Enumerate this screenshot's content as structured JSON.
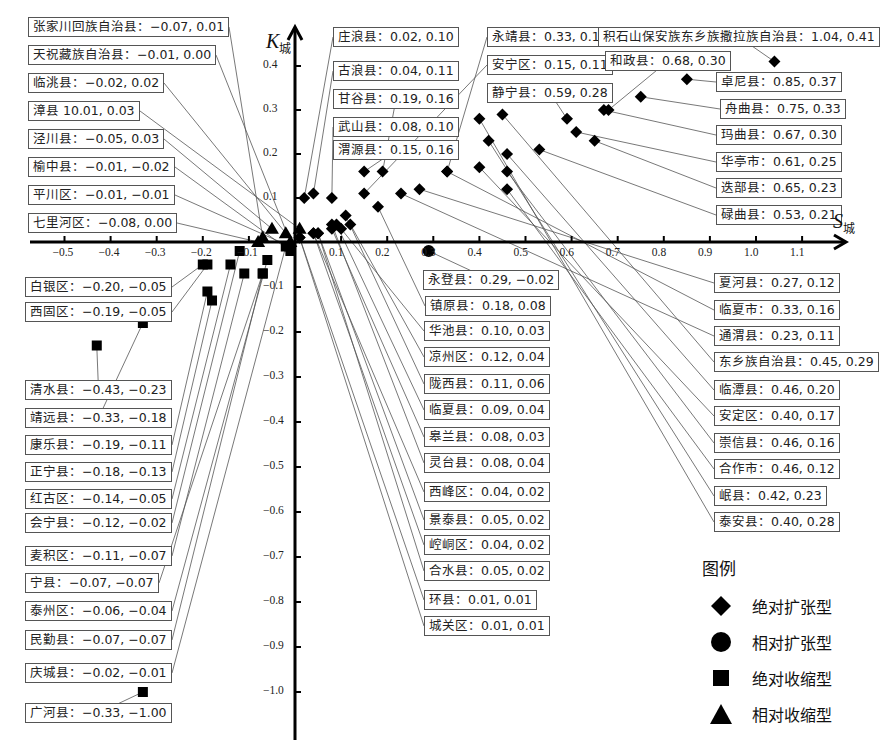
{
  "chart_data": {
    "type": "scatter",
    "title": "",
    "xlabel": "S城",
    "ylabel": "K城",
    "xlim": [
      -0.55,
      1.15
    ],
    "ylim": [
      -1.08,
      0.47
    ],
    "x_ticks": [
      "-0.5",
      "-0.4",
      "-0.3",
      "-0.2",
      "-0.1",
      "0.1",
      "0.2",
      "0.3",
      "0.4",
      "0.5",
      "0.6",
      "0.7",
      "0.8",
      "0.9",
      "1.0",
      "1.1"
    ],
    "y_ticks": [
      "0.4",
      "0.3",
      "0.2",
      "0.1",
      "-0.1",
      "-0.2",
      "-0.3",
      "-0.4",
      "-0.5",
      "-0.6",
      "-0.7",
      "-0.8",
      "-0.9",
      "-1.0"
    ],
    "grid": false,
    "legend_position": "bottom-right",
    "legend": {
      "title": "图例",
      "items": [
        {
          "label": "绝对扩张型",
          "marker": "diamond"
        },
        {
          "label": "相对扩张型",
          "marker": "circle"
        },
        {
          "label": "绝对收缩型",
          "marker": "square"
        },
        {
          "label": "相对收缩型",
          "marker": "triangle"
        }
      ]
    },
    "series": [
      {
        "name": "绝对扩张型",
        "marker": "diamond",
        "points": [
          {
            "name": "积石山保安族东乡族撒拉族自治县",
            "x": 1.04,
            "y": 0.41
          },
          {
            "name": "卓尼县",
            "x": 0.85,
            "y": 0.37
          },
          {
            "name": "舟曲县",
            "x": 0.75,
            "y": 0.33
          },
          {
            "name": "和政县",
            "x": 0.68,
            "y": 0.3
          },
          {
            "name": "玛曲县",
            "x": 0.67,
            "y": 0.3
          },
          {
            "name": "迭部县",
            "x": 0.65,
            "y": 0.23
          },
          {
            "name": "华亭市",
            "x": 0.61,
            "y": 0.25
          },
          {
            "name": "静宁县",
            "x": 0.59,
            "y": 0.28
          },
          {
            "name": "碌曲县",
            "x": 0.53,
            "y": 0.21
          },
          {
            "name": "临潭县",
            "x": 0.46,
            "y": 0.2
          },
          {
            "name": "崇信县",
            "x": 0.46,
            "y": 0.16
          },
          {
            "name": "合作市",
            "x": 0.46,
            "y": 0.12
          },
          {
            "name": "东乡族自治县",
            "x": 0.45,
            "y": 0.29
          },
          {
            "name": "岷县",
            "x": 0.42,
            "y": 0.23
          },
          {
            "name": "安定区",
            "x": 0.4,
            "y": 0.17
          },
          {
            "name": "泰安县",
            "x": 0.4,
            "y": 0.28
          },
          {
            "name": "永靖县",
            "x": 0.33,
            "y": 0.16
          },
          {
            "name": "临夏市",
            "x": 0.33,
            "y": 0.16
          },
          {
            "name": "夏河县",
            "x": 0.27,
            "y": 0.12
          },
          {
            "name": "通渭县",
            "x": 0.23,
            "y": 0.11
          },
          {
            "name": "甘谷县",
            "x": 0.19,
            "y": 0.16
          },
          {
            "name": "镇原县",
            "x": 0.18,
            "y": 0.08
          },
          {
            "name": "渭源县",
            "x": 0.15,
            "y": 0.16
          },
          {
            "name": "安宁区",
            "x": 0.15,
            "y": 0.11
          },
          {
            "name": "凉州区",
            "x": 0.12,
            "y": 0.04
          },
          {
            "name": "陇西县",
            "x": 0.11,
            "y": 0.06
          },
          {
            "name": "华池县",
            "x": 0.1,
            "y": 0.03
          },
          {
            "name": "临夏县",
            "x": 0.09,
            "y": 0.04
          },
          {
            "name": "武山县",
            "x": 0.08,
            "y": 0.1
          },
          {
            "name": "皋兰县",
            "x": 0.08,
            "y": 0.03
          },
          {
            "name": "灵台县",
            "x": 0.08,
            "y": 0.04
          },
          {
            "name": "景泰县",
            "x": 0.05,
            "y": 0.02
          },
          {
            "name": "合水县",
            "x": 0.05,
            "y": 0.02
          },
          {
            "name": "古浪县",
            "x": 0.04,
            "y": 0.11
          },
          {
            "name": "西峰区",
            "x": 0.04,
            "y": 0.02
          },
          {
            "name": "崆峒区",
            "x": 0.04,
            "y": 0.02
          },
          {
            "name": "庄浪县",
            "x": 0.02,
            "y": 0.1
          },
          {
            "name": "环县",
            "x": 0.01,
            "y": 0.01
          },
          {
            "name": "城关区",
            "x": 0.01,
            "y": 0.01
          }
        ]
      },
      {
        "name": "相对扩张型",
        "marker": "circle",
        "points": [
          {
            "name": "永登县",
            "x": 0.29,
            "y": -0.02
          }
        ]
      },
      {
        "name": "绝对收缩型",
        "marker": "square",
        "points": [
          {
            "name": "清水县",
            "x": -0.43,
            "y": -0.23
          },
          {
            "name": "靖远县",
            "x": -0.33,
            "y": -0.18
          },
          {
            "name": "广河县",
            "x": -0.33,
            "y": -1.0
          },
          {
            "name": "白银区",
            "x": -0.2,
            "y": -0.05
          },
          {
            "name": "西固区",
            "x": -0.19,
            "y": -0.05
          },
          {
            "name": "康乐县",
            "x": -0.19,
            "y": -0.11
          },
          {
            "name": "正宁县",
            "x": -0.18,
            "y": -0.13
          },
          {
            "name": "红古区",
            "x": -0.14,
            "y": -0.05
          },
          {
            "name": "会宁县",
            "x": -0.12,
            "y": -0.02
          },
          {
            "name": "麦积区",
            "x": -0.11,
            "y": -0.07
          },
          {
            "name": "宁县",
            "x": -0.07,
            "y": -0.07
          },
          {
            "name": "民勤县",
            "x": -0.07,
            "y": -0.07
          },
          {
            "name": "泰州区",
            "x": -0.06,
            "y": -0.04
          },
          {
            "name": "庆城县",
            "x": -0.02,
            "y": -0.01
          },
          {
            "name": "榆中县",
            "x": -0.01,
            "y": -0.02
          },
          {
            "name": "平川区",
            "x": -0.01,
            "y": -0.01
          }
        ]
      },
      {
        "name": "相对收缩型",
        "marker": "triangle",
        "points": [
          {
            "name": "七里河区",
            "x": -0.08,
            "y": 0.0
          },
          {
            "name": "张家川回族自治县",
            "x": -0.07,
            "y": 0.01
          },
          {
            "name": "泾川县",
            "x": -0.05,
            "y": 0.03
          },
          {
            "name": "临洮县",
            "x": -0.02,
            "y": 0.02
          },
          {
            "name": "天祝藏族自治县",
            "x": -0.01,
            "y": 0.0
          },
          {
            "name": "漳县",
            "x": 0.01,
            "y": 0.03
          }
        ]
      }
    ],
    "labels": [
      {
        "text": "张家川回族自治县：−0.07, 0.01",
        "x": 28,
        "y": 17,
        "px": -0.07,
        "py": 0.01
      },
      {
        "text": "天祝藏族自治县：−0.01, 0.00",
        "x": 28,
        "y": 45,
        "px": -0.01,
        "py": 0.0
      },
      {
        "text": "临洮县：−0.02, 0.02",
        "x": 28,
        "y": 73,
        "px": -0.02,
        "py": 0.02
      },
      {
        "text": "漳县 10.01, 0.03",
        "x": 28,
        "y": 101,
        "px": 0.01,
        "py": 0.03
      },
      {
        "text": "泾川县：−0.05, 0.03",
        "x": 28,
        "y": 129,
        "px": -0.05,
        "py": 0.03
      },
      {
        "text": "榆中县：−0.01, −0.02",
        "x": 28,
        "y": 157,
        "px": -0.01,
        "py": -0.02
      },
      {
        "text": "平川区：−0.01, −0.01",
        "x": 28,
        "y": 185,
        "px": -0.01,
        "py": -0.01
      },
      {
        "text": "七里河区：−0.08, 0.00",
        "x": 28,
        "y": 213,
        "px": -0.08,
        "py": 0.0
      },
      {
        "text": "白银区：−0.20, −0.05",
        "x": 25,
        "y": 277,
        "px": -0.2,
        "py": -0.05
      },
      {
        "text": "西固区：−0.19, −0.05",
        "x": 25,
        "y": 302,
        "px": -0.19,
        "py": -0.05
      },
      {
        "text": "清水县：−0.43, −0.23",
        "x": 25,
        "y": 380,
        "px": -0.43,
        "py": -0.23
      },
      {
        "text": "靖远县：−0.33, −0.18",
        "x": 25,
        "y": 408,
        "px": -0.33,
        "py": -0.18
      },
      {
        "text": "康乐县：−0.19, −0.11",
        "x": 25,
        "y": 435,
        "px": -0.19,
        "py": -0.11
      },
      {
        "text": "正宁县：−0.18, −0.13",
        "x": 25,
        "y": 462,
        "px": -0.18,
        "py": -0.13
      },
      {
        "text": "红古区：−0.14, −0.05",
        "x": 25,
        "y": 489,
        "px": -0.14,
        "py": -0.05
      },
      {
        "text": "会宁县：−0.12, −0.02",
        "x": 25,
        "y": 513,
        "px": -0.12,
        "py": -0.02
      },
      {
        "text": "麦积区：−0.11, −0.07",
        "x": 25,
        "y": 546,
        "px": -0.11,
        "py": -0.07
      },
      {
        "text": "宁县：−0.07, −0.07",
        "x": 25,
        "y": 573,
        "px": -0.07,
        "py": -0.07
      },
      {
        "text": "泰州区：−0.06, −0.04",
        "x": 25,
        "y": 601,
        "px": -0.06,
        "py": -0.04
      },
      {
        "text": "民勤县：−0.07, −0.07",
        "x": 25,
        "y": 630,
        "px": -0.07,
        "py": -0.07
      },
      {
        "text": "庆城县：−0.02, −0.01",
        "x": 25,
        "y": 663,
        "px": -0.02,
        "py": -0.01
      },
      {
        "text": "广河县：−0.33, −1.00",
        "x": 25,
        "y": 703,
        "px": -0.33,
        "py": -1.0
      },
      {
        "text": "庄浪县：0.02, 0.10",
        "x": 333,
        "y": 27,
        "px": 0.02,
        "py": 0.1
      },
      {
        "text": "古浪县：0.04, 0.11",
        "x": 333,
        "y": 61,
        "px": 0.04,
        "py": 0.11
      },
      {
        "text": "甘谷县：0.19, 0.16",
        "x": 333,
        "y": 89,
        "px": 0.19,
        "py": 0.16
      },
      {
        "text": "武山县：0.08, 0.10",
        "x": 333,
        "y": 117,
        "px": 0.08,
        "py": 0.1
      },
      {
        "text": "渭源县：0.15, 0.16",
        "x": 333,
        "y": 140,
        "px": 0.15,
        "py": 0.16
      },
      {
        "text": "永靖县：0.33, 0.16",
        "x": 487,
        "y": 27,
        "px": 0.33,
        "py": 0.16
      },
      {
        "text": "安宁区：0.15, 0.11",
        "x": 487,
        "y": 55,
        "px": 0.15,
        "py": 0.11
      },
      {
        "text": "静宁县：0.59, 0.28",
        "x": 487,
        "y": 83,
        "px": 0.59,
        "py": 0.28
      },
      {
        "text": "积石山保安族东乡族撒拉族自治县：1.04, 0.41",
        "x": 598,
        "y": 27,
        "px": 1.04,
        "py": 0.41
      },
      {
        "text": "和政县：0.68, 0.30",
        "x": 605,
        "y": 51,
        "px": 0.68,
        "py": 0.3
      },
      {
        "text": "卓尼县：0.85, 0.37",
        "x": 716,
        "y": 72,
        "px": 0.85,
        "py": 0.37
      },
      {
        "text": "舟曲县：0.75, 0.33",
        "x": 720,
        "y": 99,
        "px": 0.75,
        "py": 0.33
      },
      {
        "text": "玛曲县：0.67, 0.30",
        "x": 716,
        "y": 125,
        "px": 0.67,
        "py": 0.3
      },
      {
        "text": "华亭市：0.61, 0.25",
        "x": 716,
        "y": 152,
        "px": 0.61,
        "py": 0.25
      },
      {
        "text": "迭部县：0.65, 0.23",
        "x": 716,
        "y": 178,
        "px": 0.65,
        "py": 0.23
      },
      {
        "text": "碌曲县：0.53, 0.21",
        "x": 716,
        "y": 205,
        "px": 0.53,
        "py": 0.21
      },
      {
        "text": "永登县：0.29, −0.02",
        "x": 423,
        "y": 270,
        "px": 0.29,
        "py": -0.02
      },
      {
        "text": "镇原县：0.18, 0.08",
        "x": 425,
        "y": 296,
        "px": 0.18,
        "py": 0.08
      },
      {
        "text": "华池县：0.10, 0.03",
        "x": 424,
        "y": 321,
        "px": 0.1,
        "py": 0.03
      },
      {
        "text": "凉州区：0.12, 0.04",
        "x": 424,
        "y": 347,
        "px": 0.12,
        "py": 0.04
      },
      {
        "text": "陇西县：0.11, 0.06",
        "x": 424,
        "y": 374,
        "px": 0.11,
        "py": 0.06
      },
      {
        "text": "临夏县：0.09, 0.04",
        "x": 424,
        "y": 400,
        "px": 0.09,
        "py": 0.04
      },
      {
        "text": "皋兰县：0.08, 0.03",
        "x": 424,
        "y": 427,
        "px": 0.08,
        "py": 0.03
      },
      {
        "text": "灵台县：0.08, 0.04",
        "x": 424,
        "y": 453,
        "px": 0.08,
        "py": 0.04
      },
      {
        "text": "西峰区：0.04, 0.02",
        "x": 424,
        "y": 482,
        "px": 0.04,
        "py": 0.02
      },
      {
        "text": "景泰县：0.05, 0.02",
        "x": 424,
        "y": 510,
        "px": 0.05,
        "py": 0.02
      },
      {
        "text": "崆峒区：0.04, 0.02",
        "x": 424,
        "y": 535,
        "px": 0.04,
        "py": 0.02
      },
      {
        "text": "合水县：0.05, 0.02",
        "x": 424,
        "y": 561,
        "px": 0.05,
        "py": 0.02
      },
      {
        "text": "环县：0.01, 0.01",
        "x": 424,
        "y": 590,
        "px": 0.01,
        "py": 0.01
      },
      {
        "text": "城关区：0.01, 0.01",
        "x": 424,
        "y": 616,
        "px": 0.01,
        "py": 0.01
      },
      {
        "text": "夏河县：0.27, 0.12",
        "x": 714,
        "y": 273,
        "px": 0.27,
        "py": 0.12
      },
      {
        "text": "临夏市：0.33, 0.16",
        "x": 714,
        "y": 300,
        "px": 0.33,
        "py": 0.16
      },
      {
        "text": "通渭县：0.23, 0.11",
        "x": 714,
        "y": 326,
        "px": 0.23,
        "py": 0.11
      },
      {
        "text": "东乡族自治县：0.45, 0.29",
        "x": 714,
        "y": 352,
        "px": 0.45,
        "py": 0.29
      },
      {
        "text": "临潭县：0.46, 0.20",
        "x": 714,
        "y": 380,
        "px": 0.46,
        "py": 0.2
      },
      {
        "text": "安定区：0.40, 0.17",
        "x": 714,
        "y": 406,
        "px": 0.4,
        "py": 0.17
      },
      {
        "text": "崇信县：0.46, 0.16",
        "x": 714,
        "y": 433,
        "px": 0.46,
        "py": 0.16
      },
      {
        "text": "合作市：0.46, 0.12",
        "x": 714,
        "y": 459,
        "px": 0.46,
        "py": 0.12
      },
      {
        "text": "岷县：0.42, 0.23",
        "x": 714,
        "y": 486,
        "px": 0.42,
        "py": 0.23
      },
      {
        "text": "泰安县：0.40, 0.28",
        "x": 714,
        "y": 512,
        "px": 0.4,
        "py": 0.28
      }
    ]
  }
}
